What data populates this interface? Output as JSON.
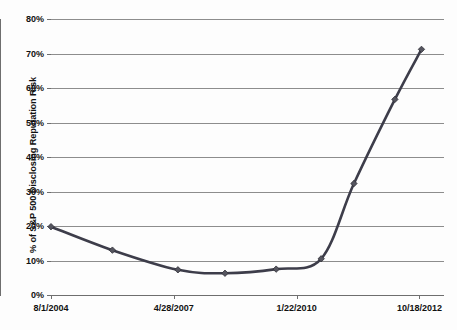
{
  "chart_data": {
    "type": "line",
    "title": "",
    "xlabel": "",
    "ylabel": "% of S&P 500 Disclosing Reputation Risk",
    "ylim": [
      0,
      80
    ],
    "ytick_labels": [
      "0%",
      "10%",
      "20%",
      "30%",
      "40%",
      "50%",
      "60%",
      "70%",
      "80%"
    ],
    "ytick_values": [
      0,
      10,
      20,
      30,
      40,
      50,
      60,
      70,
      80
    ],
    "xtick_labels": [
      "8/1/2004",
      "4/28/2007",
      "1/22/2010",
      "10/18/2012"
    ],
    "xtick_values": [
      0,
      3,
      6,
      9
    ],
    "xlim": [
      0,
      9.6
    ],
    "grid": "horizontal",
    "legend": "none",
    "series": [
      {
        "name": "% of S&P 500 Disclosing Reputation Risk",
        "color": "#3d3d4a",
        "marker": "diamond",
        "marker_color": "#55555f",
        "x": [
          0,
          1.5,
          3.1,
          4.25,
          5.5,
          6.6,
          7.4,
          8.4,
          9.05
        ],
        "values": [
          19.8,
          13.0,
          7.3,
          6.3,
          7.5,
          10.5,
          32.3,
          56.7,
          71.2
        ]
      }
    ]
  },
  "figure": {
    "caption": ""
  }
}
